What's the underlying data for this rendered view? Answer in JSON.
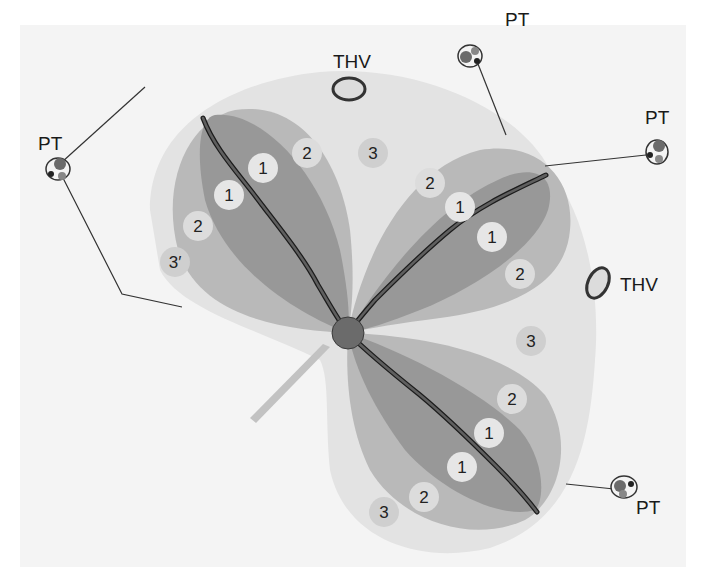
{
  "figure": {
    "colors": {
      "background": "#ffffff",
      "panel": "#f4f4f4",
      "outer_zone": "#e3e3e3",
      "mid_zone": "#b9b9b9",
      "inner_zone": "#989898",
      "vein": "#5f5f5f",
      "vein_outline": "#1c1c1c",
      "center_node": "#6b6b6b",
      "stem": "#c2c2c2",
      "badge_zone1": "#e6e6e6",
      "badge_zone2": "#dcdcdc",
      "badge_zone3": "#cfcfcf"
    },
    "labels": {
      "pt_left": "PT",
      "pt_top": "PT",
      "pt_right": "PT",
      "pt_bottom": "PT",
      "thv_top": "THV",
      "thv_right": "THV"
    },
    "zones": {
      "upper_left": [
        "1",
        "1",
        "2",
        "2",
        "3′"
      ],
      "upper_right": [
        "2",
        "1",
        "1",
        "2"
      ],
      "lower": [
        "2",
        "1",
        "1",
        "2",
        "3"
      ],
      "between": [
        "3",
        "3"
      ]
    },
    "badges": [
      {
        "text": "1",
        "x": 263,
        "y": 168,
        "zone": 1
      },
      {
        "text": "1",
        "x": 229,
        "y": 195,
        "zone": 1
      },
      {
        "text": "2",
        "x": 307,
        "y": 153,
        "zone": 2
      },
      {
        "text": "2",
        "x": 198,
        "y": 226,
        "zone": 2
      },
      {
        "text": "3′",
        "x": 175,
        "y": 262,
        "zone": 3
      },
      {
        "text": "3",
        "x": 373,
        "y": 153,
        "zone": 3
      },
      {
        "text": "2",
        "x": 430,
        "y": 183,
        "zone": 2
      },
      {
        "text": "1",
        "x": 460,
        "y": 207,
        "zone": 1
      },
      {
        "text": "1",
        "x": 492,
        "y": 237,
        "zone": 1
      },
      {
        "text": "2",
        "x": 520,
        "y": 274,
        "zone": 2
      },
      {
        "text": "3",
        "x": 531,
        "y": 341,
        "zone": 3
      },
      {
        "text": "2",
        "x": 512,
        "y": 399,
        "zone": 2
      },
      {
        "text": "1",
        "x": 489,
        "y": 433,
        "zone": 1
      },
      {
        "text": "1",
        "x": 462,
        "y": 467,
        "zone": 1
      },
      {
        "text": "2",
        "x": 424,
        "y": 497,
        "zone": 2
      },
      {
        "text": "3",
        "x": 384,
        "y": 512,
        "zone": 3
      }
    ]
  }
}
